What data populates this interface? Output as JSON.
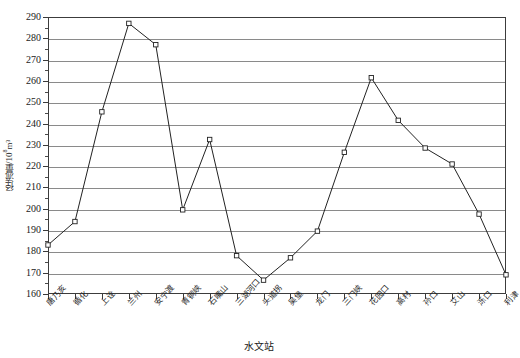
{
  "chart_data": {
    "type": "line",
    "title": "",
    "xlabel": "水文站",
    "ylabel": "径流量/10⁸m³",
    "ylabel_main": "径流量/10",
    "ylabel_sup": "8",
    "ylabel_tail": "m³",
    "ylim": [
      160,
      290
    ],
    "ytick_step": 10,
    "yticks": [
      160,
      170,
      180,
      190,
      200,
      210,
      220,
      230,
      240,
      250,
      260,
      270,
      280,
      290
    ],
    "ytick_labels": [
      "160",
      "170",
      "180",
      "190",
      "200",
      "210",
      "220",
      "230",
      "240",
      "250",
      "260",
      "270",
      "280",
      "290"
    ],
    "grid": true,
    "grid_axis": "y",
    "legend": false,
    "marker": "open-square",
    "line_color": "#222222",
    "grid_color": "#8a8a8a",
    "axis_color": "#3c3c3c",
    "categories": [
      "唐乃亥",
      "循化",
      "上诠",
      "兰州",
      "安宁渡",
      "青铜峡",
      "石嘴山",
      "三湖河口",
      "头道拐",
      "吴堡",
      "龙门",
      "三门峡",
      "花园口",
      "高村",
      "孙口",
      "艾山",
      "泺口",
      "利津"
    ],
    "values": [
      183,
      194,
      245.5,
      287,
      277,
      199.5,
      232.5,
      178,
      166.5,
      177,
      189.5,
      226.5,
      261.5,
      241.5,
      228.5,
      221,
      197.5,
      169
    ],
    "series": [
      {
        "name": "径流量",
        "values": [
          183,
          194,
          245.5,
          287,
          277,
          199.5,
          232.5,
          178,
          166.5,
          177,
          189.5,
          226.5,
          261.5,
          241.5,
          228.5,
          221,
          197.5,
          169
        ]
      }
    ]
  }
}
